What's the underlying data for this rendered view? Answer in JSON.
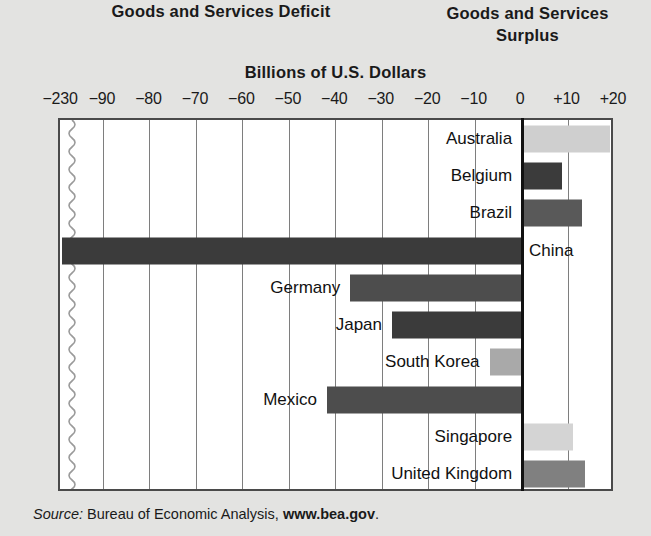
{
  "headers": {
    "deficit": "Goods and Services Deficit",
    "surplus_line1": "Goods and Services",
    "surplus_line2": "Surplus",
    "units": "Billions of U.S. Dollars"
  },
  "source": {
    "label": "Source:",
    "agency": "Bureau of Economic Analysis,",
    "site": "www.bea.gov",
    "period": "."
  },
  "chart_data": {
    "type": "bar",
    "orientation": "horizontal",
    "title": "Billions of U.S. Dollars",
    "xlabel": "Billions of U.S. Dollars",
    "ylabel": "",
    "xlim": [
      -230,
      20
    ],
    "axis_break": true,
    "axis_break_between": [
      -230,
      -90
    ],
    "grid": true,
    "legend": "none",
    "tick_labels": [
      "−230",
      "−90",
      "−80",
      "−70",
      "−60",
      "−50",
      "−40",
      "−30",
      "−20",
      "−10",
      "0",
      "+10",
      "+20"
    ],
    "tick_values": [
      -230,
      -90,
      -80,
      -70,
      -60,
      -50,
      -40,
      -30,
      -20,
      -10,
      0,
      10,
      20
    ],
    "categories": [
      "Australia",
      "Belgium",
      "Brazil",
      "China",
      "Germany",
      "Japan",
      "South Korea",
      "Mexico",
      "Singapore",
      "United Kingdom"
    ],
    "values": [
      19,
      8.5,
      13,
      -232,
      -37,
      -28,
      -7,
      -42,
      11,
      13.5
    ],
    "bar_colors": [
      "#cfcfcf",
      "#3b3b3b",
      "#595959",
      "#3b3b3b",
      "#4d4d4d",
      "#3b3b3b",
      "#a9a9a9",
      "#4d4d4d",
      "#d4d4d4",
      "#808080"
    ],
    "bars": [
      {
        "name": "Australia",
        "value": 19,
        "color": "#cfcfcf",
        "side": "surplus"
      },
      {
        "name": "Belgium",
        "value": 8.5,
        "color": "#3b3b3b",
        "side": "surplus"
      },
      {
        "name": "Brazil",
        "value": 13,
        "color": "#595959",
        "side": "surplus"
      },
      {
        "name": "China",
        "value": -232,
        "color": "#3b3b3b",
        "side": "deficit"
      },
      {
        "name": "Germany",
        "value": -37,
        "color": "#4d4d4d",
        "side": "deficit"
      },
      {
        "name": "Japan",
        "value": -28,
        "color": "#3b3b3b",
        "side": "deficit"
      },
      {
        "name": "South Korea",
        "value": -7,
        "color": "#a9a9a9",
        "side": "deficit"
      },
      {
        "name": "Mexico",
        "value": -42,
        "color": "#4d4d4d",
        "side": "deficit"
      },
      {
        "name": "Singapore",
        "value": 11,
        "color": "#d4d4d4",
        "side": "surplus"
      },
      {
        "name": "United Kingdom",
        "value": 13.5,
        "color": "#808080",
        "side": "surplus"
      }
    ]
  },
  "colors": {
    "page_background": "#e3e3e1",
    "plot_background": "#ffffff",
    "plot_border": "#4a4a4a",
    "gridline": "#7e7e7e",
    "zero_axis": "#111111",
    "text": "#1a1a1a"
  }
}
